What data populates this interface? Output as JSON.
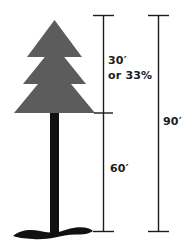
{
  "diagram": {
    "colors": {
      "canopy": "#5c5c5c",
      "trunk": "#111111",
      "base": "#111111",
      "dimension_line": "#1c1c1c",
      "text": "#1c1c1c",
      "background": "#ffffff"
    },
    "tree": {
      "canopy_tiers": 3,
      "trunk_shape": "vertical-bar",
      "base_shape": "wavy-root-foot"
    },
    "measurements": {
      "upper": {
        "value": "30′",
        "alternate": "or 33%",
        "name": "canopy-height"
      },
      "lower": {
        "value": "60′",
        "name": "trunk-height"
      },
      "total": {
        "value": "90′",
        "name": "total-height"
      }
    }
  }
}
